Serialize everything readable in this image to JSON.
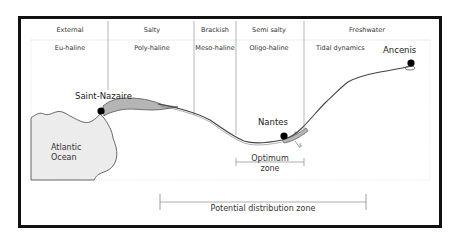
{
  "figure": {
    "header_row": [
      {
        "label": "External"
      },
      {
        "label": "Salty"
      },
      {
        "label": "Brackish"
      },
      {
        "label": "Semi salty"
      },
      {
        "label": "Freshwater"
      }
    ],
    "salinity_row": [
      {
        "label": "Eu-haline"
      },
      {
        "label": "Poly-haline"
      },
      {
        "label": "Meso-haline"
      },
      {
        "label": "Oligo-haline"
      },
      {
        "label": "Tidal dynamics"
      }
    ],
    "places": {
      "saint_nazaire": "Saint-Nazaire",
      "nantes": "Nantes",
      "ancenis": "Ancenis",
      "ocean_line1": "Atlantic",
      "ocean_line2": "Ocean"
    },
    "zones": {
      "optimum_line1": "Optimum",
      "optimum_line2": "zone",
      "potential": "Potential distribution zone"
    },
    "markers": {
      "small_label_1": "x",
      "small_label_2": "5"
    },
    "colors": {
      "frame": "#111111",
      "estuary_fill": "#b5b5b5",
      "land_fill": "#ececec",
      "divider": "#999999"
    }
  }
}
